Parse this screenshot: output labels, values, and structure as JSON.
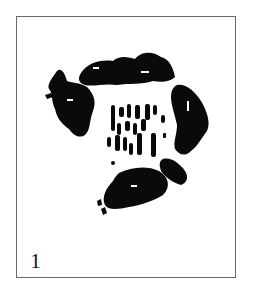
{
  "figure": {
    "label": "1",
    "frame_color": "#6a6a6a",
    "ink_color": "#0a0a0a",
    "background_color": "#ffffff"
  }
}
